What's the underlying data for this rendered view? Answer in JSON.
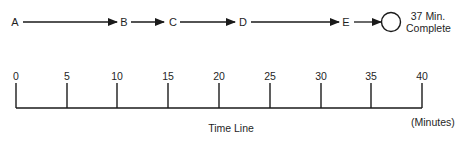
{
  "flow": {
    "nodes": [
      {
        "id": "A",
        "label": "A",
        "x": 15
      },
      {
        "id": "B",
        "label": "B",
        "x": 124
      },
      {
        "id": "C",
        "label": "C",
        "x": 172
      },
      {
        "id": "D",
        "label": "D",
        "x": 243
      },
      {
        "id": "E",
        "label": "E",
        "x": 346
      }
    ],
    "end": {
      "line1": "37 Min.",
      "line2": "Complete"
    }
  },
  "timeline": {
    "ticks": [
      "0",
      "5",
      "10",
      "15",
      "20",
      "25",
      "30",
      "35",
      "40"
    ],
    "title": "Time Line",
    "unit": "(Minutes)"
  },
  "colors": {
    "stroke": "#1a1a1a",
    "background": "#ffffff"
  }
}
